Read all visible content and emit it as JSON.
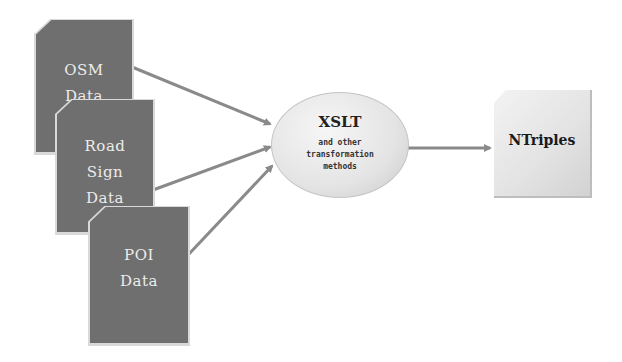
{
  "diagram": {
    "inputs": [
      {
        "id": "osm",
        "lines": [
          "OSM",
          "Data"
        ]
      },
      {
        "id": "road-sign",
        "lines": [
          "Road",
          "Sign",
          "Data"
        ]
      },
      {
        "id": "poi",
        "lines": [
          "POI",
          "Data"
        ]
      }
    ],
    "process": {
      "title": "XSLT",
      "subtitle_lines": [
        "and other",
        "transformation",
        "methods"
      ]
    },
    "output": {
      "label": "NTriples"
    },
    "colors": {
      "input_fill": "#6f6f6f",
      "input_text": "#ececec",
      "arrow": "#8a8a8a",
      "process_fill": "#e4e4e4",
      "output_fill": "#e2e2e2"
    },
    "edges": [
      {
        "from": "osm",
        "to": "process"
      },
      {
        "from": "road-sign",
        "to": "process"
      },
      {
        "from": "poi",
        "to": "process"
      },
      {
        "from": "process",
        "to": "output"
      }
    ]
  }
}
